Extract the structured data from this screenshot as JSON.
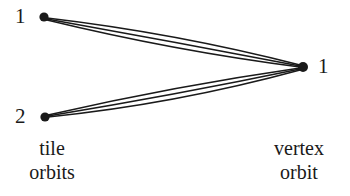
{
  "figure": {
    "type": "bipartite-multigraph",
    "background_color": "#ffffff",
    "stroke_color": "#1a1a1a"
  },
  "nodes": {
    "tile_orbit_1": {
      "label": "1",
      "x": 44,
      "y": 17,
      "radius": 4.2
    },
    "tile_orbit_2": {
      "label": "2",
      "x": 45,
      "y": 117,
      "radius": 4.2
    },
    "vertex_orbit_1": {
      "label": "1",
      "x": 303,
      "y": 67,
      "radius": 4.6
    }
  },
  "edges": [
    {
      "from": "tile_orbit_1",
      "to": "vertex_orbit_1",
      "bow": -9
    },
    {
      "from": "tile_orbit_1",
      "to": "vertex_orbit_1",
      "bow": -2
    },
    {
      "from": "tile_orbit_1",
      "to": "vertex_orbit_1",
      "bow": 6
    },
    {
      "from": "tile_orbit_2",
      "to": "vertex_orbit_1",
      "bow": -6
    },
    {
      "from": "tile_orbit_2",
      "to": "vertex_orbit_1",
      "bow": 2
    },
    {
      "from": "tile_orbit_2",
      "to": "vertex_orbit_1",
      "bow": 9
    }
  ],
  "captions": {
    "left": {
      "line1": "tile",
      "line2": "orbits"
    },
    "right": {
      "line1": "vertex",
      "line2": "orbit"
    }
  }
}
